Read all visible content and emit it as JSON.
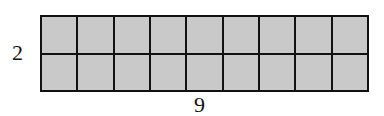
{
  "figure": {
    "type": "area-model-grid",
    "rows": 2,
    "columns": 9,
    "row_label": "2",
    "column_label": "9",
    "cell_fill_color": "#c9c9c9",
    "line_color": "#111111"
  }
}
